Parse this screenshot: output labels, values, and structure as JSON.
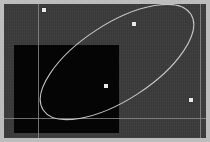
{
  "window": {
    "title": "Ellipse Editor Canvas",
    "width": 210,
    "height": 142
  },
  "canvas": {
    "name": "drawing-canvas",
    "background_color": "#3b3b3b",
    "frame_color": "#bdbdbd",
    "x": 4,
    "y": 4,
    "width": 202,
    "height": 134
  },
  "shapes": {
    "black_rectangle": {
      "label": "filled-rectangle",
      "fill_color": "#050505",
      "x": 14,
      "y": 45,
      "width": 105,
      "height": 88
    },
    "ellipse": {
      "label": "rotated-ellipse",
      "stroke_color": "#d2d2d2",
      "stroke_width": 1.1,
      "center_x": 117,
      "center_y": 62,
      "radius_x": 88,
      "radius_y": 38,
      "rotation_deg": -33
    }
  },
  "guides": [
    {
      "label": "guide-vertical-left",
      "orientation": "vertical",
      "position": 38
    },
    {
      "label": "guide-vertical-right",
      "orientation": "vertical",
      "position": 200
    },
    {
      "label": "guide-horizontal-bottom",
      "orientation": "horizontal",
      "position": 118
    }
  ],
  "handles": [
    {
      "label": "handle-top-left",
      "x": 44,
      "y": 10
    },
    {
      "label": "handle-top-right",
      "x": 134,
      "y": 24
    },
    {
      "label": "handle-center",
      "x": 106,
      "y": 86
    },
    {
      "label": "handle-bottom-right",
      "x": 191,
      "y": 100
    }
  ],
  "colors": {
    "stroke": "#d2d2d2",
    "handle": "#e9e9e9",
    "guide": "#8e8e8e",
    "fill": "#050505",
    "canvas": "#3b3b3b",
    "frame": "#bdbdbd"
  }
}
